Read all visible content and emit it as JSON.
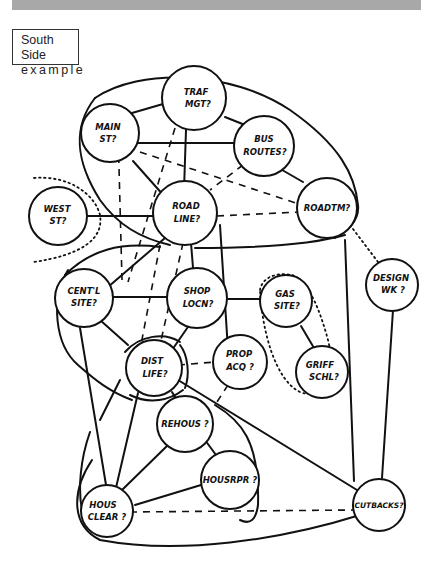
{
  "header": {
    "banner_color": "#a8a8a8"
  },
  "label": {
    "line1": "South Side",
    "line2": "example"
  },
  "diagram": {
    "nodes": [
      {
        "id": "traf_mgt",
        "line1": "TRAF",
        "line2": "MGT?"
      },
      {
        "id": "main_st",
        "line1": "MAIN",
        "line2": "ST?"
      },
      {
        "id": "bus_routes",
        "line1": "BUS",
        "line2": "ROUTES?"
      },
      {
        "id": "west_st",
        "line1": "WEST",
        "line2": "ST?"
      },
      {
        "id": "road_line",
        "line1": "ROAD",
        "line2": "LINE?"
      },
      {
        "id": "roadtm",
        "line1": "ROADTM?",
        "line2": ""
      },
      {
        "id": "design_wk",
        "line1": "DESIGN",
        "line2": "WK ?"
      },
      {
        "id": "centl_site",
        "line1": "CENT'L",
        "line2": "SITE?"
      },
      {
        "id": "shop_locn",
        "line1": "SHOP",
        "line2": "LOCN?"
      },
      {
        "id": "gas_site",
        "line1": "GAS",
        "line2": "SITE?"
      },
      {
        "id": "griff_schl",
        "line1": "GRIFF",
        "line2": "SCHL?"
      },
      {
        "id": "prop_acq",
        "line1": "PROP",
        "line2": "ACQ ?"
      },
      {
        "id": "dist_life",
        "line1": "DIST",
        "line2": "LIFE?"
      },
      {
        "id": "rehous",
        "line1": "REHOUS ?",
        "line2": ""
      },
      {
        "id": "housrpr",
        "line1": "HOUSRPR ?",
        "line2": ""
      },
      {
        "id": "hous_clear",
        "line1": "HOUS",
        "line2": "CLEAR ?"
      },
      {
        "id": "cutbacks",
        "line1": "CUTBACKS?",
        "line2": ""
      }
    ],
    "edge_styles": {
      "solid": "strong connection",
      "dashed": "weak connection",
      "dotted": "grouping boundary"
    }
  }
}
